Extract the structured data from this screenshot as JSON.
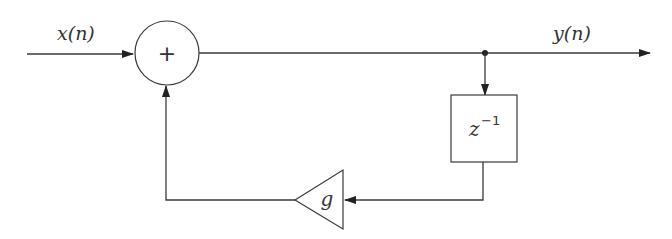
{
  "diagram": {
    "type": "block-diagram",
    "signals": {
      "input_label": "x(n)",
      "output_label": "y(n)"
    },
    "blocks": {
      "adder": {
        "symbol": "+"
      },
      "delay": {
        "base": "z",
        "exponent": "−1"
      },
      "gain": {
        "symbol": "g"
      }
    },
    "colors": {
      "stroke": "#3a3a3a",
      "text": "#333333",
      "background": "#ffffff"
    }
  }
}
